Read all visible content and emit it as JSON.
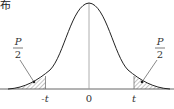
{
  "title_fragment": "布",
  "diagram": {
    "type": "t-distribution density curve with two shaded tails",
    "labels": {
      "left_area": {
        "num": "P",
        "den": "2"
      },
      "right_area": {
        "num": "P",
        "den": "2"
      },
      "x_ticks": [
        "-t",
        "0",
        "t"
      ]
    }
  }
}
